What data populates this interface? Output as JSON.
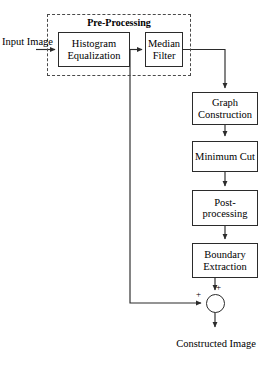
{
  "diagram": {
    "type": "flowchart",
    "background_color": "#ffffff",
    "line_color": "#2b2b2b",
    "group": {
      "label": "Pre-Processing",
      "border_style": "dashed"
    },
    "nodes": [
      {
        "id": "histogram-equalization",
        "label_line1": "Histogram",
        "label_line2": "Equalization"
      },
      {
        "id": "median-filter",
        "label_line1": "Median",
        "label_line2": "Filter"
      },
      {
        "id": "graph-construction",
        "label_line1": "Graph",
        "label_line2": "Construction"
      },
      {
        "id": "minimum-cut",
        "label_line1": "Minimum Cut",
        "label_line2": ""
      },
      {
        "id": "post-processing",
        "label_line1": "Post-",
        "label_line2": "processing"
      },
      {
        "id": "boundary-extraction",
        "label_line1": "Boundary",
        "label_line2": "Extraction"
      }
    ],
    "labels": {
      "input_line1": "Input",
      "input_line2": "Image",
      "output_line1": "Constructed",
      "output_line2": "Image",
      "summing_plus_top": "+",
      "summing_plus_left": "+"
    }
  }
}
